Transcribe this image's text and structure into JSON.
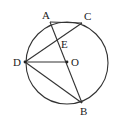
{
  "diagram": {
    "title": "",
    "circle": {
      "center": "O",
      "cx": 67,
      "cy": 63,
      "r": 41
    },
    "points": {
      "A": {
        "label": "A",
        "x": 50,
        "y": 22,
        "lx": 42,
        "ly": 19
      },
      "C": {
        "label": "C",
        "x": 82,
        "y": 23,
        "lx": 84,
        "ly": 20
      },
      "E": {
        "label": "E",
        "x": 58,
        "y": 41,
        "lx": 61,
        "ly": 48
      },
      "D": {
        "label": "D",
        "x": 25,
        "y": 62,
        "lx": 13,
        "ly": 66
      },
      "O": {
        "label": "O",
        "x": 67,
        "y": 62,
        "lx": 71,
        "ly": 66
      },
      "B": {
        "label": "B",
        "x": 82,
        "y": 103,
        "lx": 80,
        "ly": 115
      }
    },
    "segments": [
      [
        "A",
        "C"
      ],
      [
        "A",
        "B"
      ],
      [
        "C",
        "D"
      ],
      [
        "D",
        "O"
      ],
      [
        "D",
        "B"
      ]
    ]
  }
}
